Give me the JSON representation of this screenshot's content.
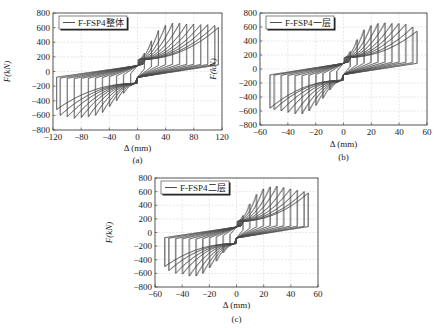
{
  "figure": {
    "panels_count": 3
  },
  "chart_data": [
    {
      "type": "line",
      "panel_label": "(a)",
      "title": "",
      "legend": [
        "F-FSP4整体"
      ],
      "legend_position": "upper-left",
      "xlabel": "Δ (mm)",
      "ylabel": "F(kN)",
      "xlim": [
        -120,
        120
      ],
      "ylim": [
        -800,
        800
      ],
      "xticks": [
        -120,
        -80,
        -40,
        0,
        40,
        80,
        120
      ],
      "yticks": [
        -800,
        -600,
        -400,
        -200,
        0,
        200,
        400,
        600,
        800
      ],
      "grid": true,
      "series": [
        {
          "name": "F-FSP4整体",
          "description": "hysteresis loops, increasing displacement amplitude",
          "loop_amplitudes_mm": [
            10,
            20,
            30,
            40,
            50,
            60,
            70,
            80,
            90,
            100,
            110,
            115
          ],
          "peak_force_pos_kN": [
            250,
            420,
            560,
            630,
            660,
            660,
            650,
            650,
            640,
            640,
            630,
            600
          ],
          "peak_force_neg_kN": [
            -200,
            -300,
            -400,
            -480,
            -560,
            -600,
            -620,
            -630,
            -640,
            -620,
            -600,
            -520
          ],
          "pinch_force_kN": 180
        }
      ]
    },
    {
      "type": "line",
      "panel_label": "(b)",
      "title": "",
      "legend": [
        "F-FSP4一层"
      ],
      "legend_position": "upper-left",
      "xlabel": "Δ (mm)",
      "ylabel": "F(kN)",
      "xlim": [
        -60,
        60
      ],
      "ylim": [
        -800,
        800
      ],
      "xticks": [
        -60,
        -40,
        -20,
        0,
        20,
        40,
        60
      ],
      "yticks": [
        -800,
        -600,
        -400,
        -200,
        0,
        200,
        400,
        600,
        800
      ],
      "grid": true,
      "series": [
        {
          "name": "F-FSP4一层",
          "description": "hysteresis loops, increasing displacement amplitude",
          "loop_amplitudes_mm": [
            5,
            10,
            15,
            20,
            25,
            30,
            35,
            40,
            45,
            50,
            53
          ],
          "peak_force_pos_kN": [
            250,
            420,
            560,
            620,
            650,
            660,
            650,
            650,
            640,
            600,
            540
          ],
          "peak_force_neg_kN": [
            -200,
            -300,
            -420,
            -520,
            -600,
            -640,
            -640,
            -620,
            -600,
            -580,
            -560
          ],
          "pinch_force_kN": 180
        }
      ]
    },
    {
      "type": "line",
      "panel_label": "(c)",
      "title": "",
      "legend": [
        "F-FSP4二层"
      ],
      "legend_position": "upper-left",
      "xlabel": "Δ (mm)",
      "ylabel": "F(kN)",
      "xlim": [
        -60,
        60
      ],
      "ylim": [
        -800,
        800
      ],
      "xticks": [
        -60,
        -40,
        -20,
        0,
        20,
        40,
        60
      ],
      "yticks": [
        -800,
        -600,
        -400,
        -200,
        0,
        200,
        400,
        600,
        800
      ],
      "grid": true,
      "series": [
        {
          "name": "F-FSP4二层",
          "description": "hysteresis loops, increasing displacement amplitude",
          "loop_amplitudes_mm": [
            5,
            10,
            15,
            20,
            25,
            30,
            35,
            40,
            45,
            50,
            53
          ],
          "peak_force_pos_kN": [
            250,
            420,
            560,
            640,
            670,
            680,
            660,
            640,
            620,
            600,
            580
          ],
          "peak_force_neg_kN": [
            -200,
            -300,
            -420,
            -520,
            -600,
            -640,
            -640,
            -610,
            -600,
            -560,
            -500
          ],
          "pinch_force_kN": 180
        }
      ]
    }
  ],
  "layout": {
    "panels": [
      {
        "plot": {
          "left": 53,
          "top": 13,
          "right": 222,
          "bottom": 130
        },
        "xlabel_y": 151,
        "panel_label_y": 163,
        "ylabel_x": 10
      },
      {
        "plot": {
          "left": 260,
          "top": 13,
          "right": 427,
          "bottom": 125
        },
        "xlabel_y": 147,
        "panel_label_y": 160,
        "ylabel_x": 216
      },
      {
        "plot": {
          "left": 155,
          "top": 178,
          "right": 318,
          "bottom": 287
        },
        "xlabel_y": 308,
        "panel_label_y": 322,
        "ylabel_x": 112
      }
    ]
  }
}
